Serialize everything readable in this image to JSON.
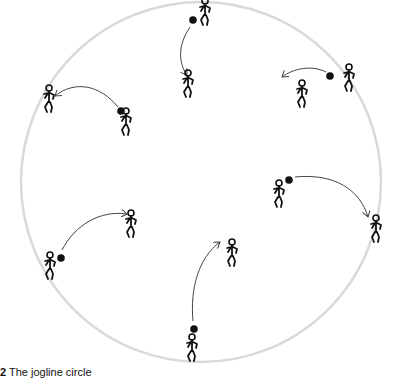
{
  "figure": {
    "caption_number": "2",
    "caption_text": "The jogline circle",
    "colors": {
      "circle": "#d9d9d9",
      "ink": "#111111",
      "arrow": "#444444"
    },
    "circle": {
      "cx": 201,
      "cy": 182,
      "r": 180
    },
    "passes": [
      {
        "id": "top",
        "thrower": {
          "x": 205,
          "y": 14
        },
        "ball": {
          "x": 193,
          "y": 20
        },
        "receiver": {
          "x": 188,
          "y": 86
        },
        "path": "M190 27 C178 45, 178 62, 187 75"
      },
      {
        "id": "upper-left",
        "thrower": {
          "x": 126,
          "y": 124
        },
        "ball": {
          "x": 121,
          "y": 111
        },
        "receiver": {
          "x": 49,
          "y": 101
        },
        "path": "M118 107 C100 85, 75 80, 55 96"
      },
      {
        "id": "upper-right",
        "thrower": {
          "x": 349,
          "y": 80
        },
        "ball": {
          "x": 330,
          "y": 76
        },
        "receiver": {
          "x": 302,
          "y": 96
        },
        "path": "M326 72 C312 65, 294 68, 282 77"
      },
      {
        "id": "right",
        "thrower": {
          "x": 279,
          "y": 196
        },
        "ball": {
          "x": 289,
          "y": 180
        },
        "receiver": {
          "x": 376,
          "y": 231
        },
        "path": "M295 177 C335 173, 360 190, 368 217"
      },
      {
        "id": "left",
        "thrower": {
          "x": 50,
          "y": 268
        },
        "ball": {
          "x": 61,
          "y": 258
        },
        "receiver": {
          "x": 131,
          "y": 226
        },
        "path": "M62 250 C75 225, 100 210, 127 214"
      },
      {
        "id": "bottom",
        "thrower": {
          "x": 192,
          "y": 350
        },
        "ball": {
          "x": 194,
          "y": 329
        },
        "receiver": {
          "x": 232,
          "y": 255
        },
        "path": "M193 321 C190 290, 198 258, 220 242"
      }
    ]
  }
}
